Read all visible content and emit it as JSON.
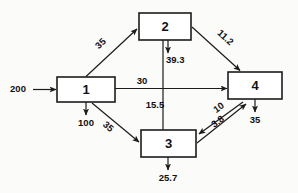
{
  "diagram": {
    "type": "flow-network-diagram",
    "background_color": "#fbfbfa",
    "line_color": "#1c1c1c",
    "nodes": [
      {
        "id": "1",
        "label": "1",
        "x": 57,
        "y": 77,
        "width": 58,
        "height": 25
      },
      {
        "id": "2",
        "label": "2",
        "x": 139,
        "y": 13,
        "width": 52,
        "height": 27
      },
      {
        "id": "3",
        "label": "3",
        "x": 141,
        "y": 130,
        "width": 55,
        "height": 27
      },
      {
        "id": "4",
        "label": "4",
        "x": 228,
        "y": 72,
        "width": 54,
        "height": 27
      }
    ],
    "external_inputs": [
      {
        "label": "200",
        "target": "1",
        "direction": "right"
      }
    ],
    "external_outputs": [
      {
        "label": "100",
        "source": "1",
        "direction": "down"
      },
      {
        "label": "39.3",
        "source": "2",
        "direction": "down"
      },
      {
        "label": "25.7",
        "source": "3",
        "direction": "down"
      },
      {
        "label": "35",
        "source": "4",
        "direction": "down"
      }
    ],
    "edges": [
      {
        "from": "1",
        "to": "2",
        "label": "35",
        "rotated": true
      },
      {
        "from": "2",
        "to": "4",
        "label": "11.2",
        "rotated": true
      },
      {
        "from": "1",
        "to": "4",
        "label": "30",
        "rotated": false
      },
      {
        "from": "2",
        "to": "3",
        "label": "15.5",
        "rotated": false
      },
      {
        "from": "1",
        "to": "3",
        "label": "35",
        "rotated": true
      },
      {
        "from": "4",
        "to": "3",
        "label": "10",
        "rotated": true
      },
      {
        "from": "3",
        "to": "4",
        "label": "3.8",
        "rotated": true
      }
    ]
  }
}
